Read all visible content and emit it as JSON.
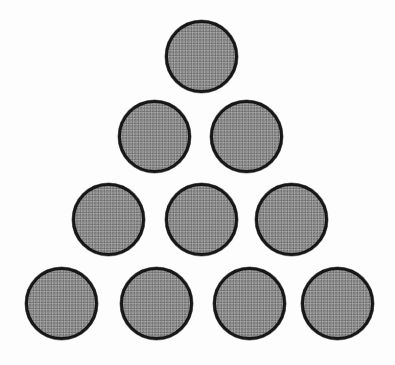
{
  "figure": {
    "shape_name": "triangular-number-ten-arrangement",
    "total_count": 10,
    "canvas": {
      "width": 395,
      "height": 365
    },
    "background_color": "#fdfdfd",
    "circle": {
      "fill_color": "#8c8c8c",
      "stroke_color": "#181818",
      "stroke_width": 3,
      "diameter": 73,
      "fill_style": "dithered-gray-halftone"
    },
    "rows": [
      {
        "index": 1,
        "count": 1,
        "center_y": 56,
        "centers_x": [
          201
        ]
      },
      {
        "index": 2,
        "count": 2,
        "center_y": 136,
        "centers_x": [
          154,
          246
        ]
      },
      {
        "index": 3,
        "count": 3,
        "center_y": 219,
        "centers_x": [
          108,
          201,
          291
        ]
      },
      {
        "index": 4,
        "count": 4,
        "center_y": 303,
        "centers_x": [
          61,
          156,
          249,
          337
        ]
      }
    ],
    "circles": [
      {
        "id": "c1",
        "row": 1,
        "col": 1,
        "cx": 201,
        "cy": 56,
        "r": 36.5
      },
      {
        "id": "c2",
        "row": 2,
        "col": 1,
        "cx": 154,
        "cy": 136,
        "r": 36.5
      },
      {
        "id": "c3",
        "row": 2,
        "col": 2,
        "cx": 246,
        "cy": 136,
        "r": 36.5
      },
      {
        "id": "c4",
        "row": 3,
        "col": 1,
        "cx": 108,
        "cy": 219,
        "r": 36.5
      },
      {
        "id": "c5",
        "row": 3,
        "col": 2,
        "cx": 201,
        "cy": 219,
        "r": 36.5
      },
      {
        "id": "c6",
        "row": 3,
        "col": 3,
        "cx": 291,
        "cy": 219,
        "r": 36.5
      },
      {
        "id": "c7",
        "row": 4,
        "col": 1,
        "cx": 61,
        "cy": 303,
        "r": 36.5
      },
      {
        "id": "c8",
        "row": 4,
        "col": 2,
        "cx": 156,
        "cy": 303,
        "r": 36.5
      },
      {
        "id": "c9",
        "row": 4,
        "col": 3,
        "cx": 249,
        "cy": 303,
        "r": 36.5
      },
      {
        "id": "c10",
        "row": 4,
        "col": 4,
        "cx": 337,
        "cy": 303,
        "r": 36.5
      }
    ]
  }
}
